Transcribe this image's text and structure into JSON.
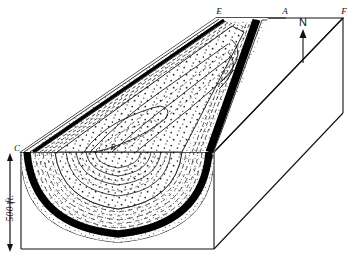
{
  "figure": {
    "kind": "geological-block-diagram",
    "background_color": "#ffffff",
    "ink_color": "#111111"
  },
  "labels": {
    "corner_e": "E",
    "corner_a": "A",
    "corner_f": "F",
    "corner_c": "C",
    "corner_d": "D",
    "center_b": "B",
    "north": "N"
  },
  "scale_bar": {
    "text": "500 ft.",
    "orientation": "vertical",
    "arrow_style": "double-headed"
  },
  "north_arrow": {
    "label": "N",
    "direction": "up"
  },
  "strata": [
    {
      "name": "outer-sandstone-stipple",
      "pattern": "stipple",
      "color": "#ffffff"
    },
    {
      "name": "coal-seam",
      "pattern": "solid-black",
      "color": "#000000"
    },
    {
      "name": "shale-dashed",
      "pattern": "dashes",
      "color": "#ffffff"
    },
    {
      "name": "inner-sandstone-stipple",
      "pattern": "stipple",
      "color": "#ffffff"
    },
    {
      "name": "core-contours",
      "pattern": "contour-lines",
      "color": "#ffffff"
    }
  ]
}
